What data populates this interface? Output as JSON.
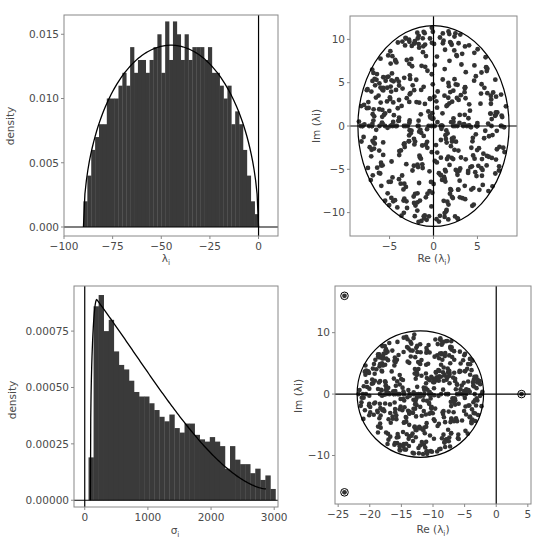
{
  "colors": {
    "bar": "#3a3a3a",
    "point": "#333333",
    "line": "#000000",
    "frame": "#888888",
    "text": "#4a4a4a"
  },
  "chart_data": [
    {
      "id": "top-left",
      "type": "bar",
      "title": "",
      "xlabel": "λi",
      "ylabel": "density",
      "xlim": [
        -100,
        10
      ],
      "ylim": [
        -0.0007,
        0.0165
      ],
      "xticks": [
        -100,
        -75,
        -50,
        -25,
        0
      ],
      "xtick_labels": [
        "−100",
        "−75",
        "−50",
        "−25",
        "0"
      ],
      "yticks": [
        0.0,
        0.005,
        0.01,
        0.015
      ],
      "ytick_labels": [
        "0.000",
        "0.005",
        "0.010",
        "0.015"
      ],
      "bin_start": -90,
      "bin_width": 2,
      "values": [
        0.002,
        0.004,
        0.006,
        0.007,
        0.008,
        0.008,
        0.01,
        0.01,
        0.01,
        0.011,
        0.012,
        0.011,
        0.014,
        0.012,
        0.013,
        0.013,
        0.012,
        0.013,
        0.014,
        0.015,
        0.012,
        0.016,
        0.013,
        0.016,
        0.015,
        0.013,
        0.015,
        0.013,
        0.014,
        0.014,
        0.014,
        0.013,
        0.014,
        0.012,
        0.012,
        0.011,
        0.01,
        0.011,
        0.008,
        0.009,
        0.008,
        0.006,
        0.004,
        0.002,
        0.001
      ],
      "curve": {
        "type": "semicircle",
        "center": -45,
        "radius": 45,
        "peak": 0.01415
      },
      "vline": 0,
      "hline": 0
    },
    {
      "id": "top-right",
      "type": "scatter",
      "xlabel": "Re (λi)",
      "ylabel": "Im (λi)",
      "xlim": [
        -9.5,
        9.5
      ],
      "ylim": [
        -12.7,
        12.7
      ],
      "xticks": [
        -5,
        0,
        5
      ],
      "xtick_labels": [
        "−5",
        "0",
        "5"
      ],
      "yticks": [
        -10,
        -5,
        0,
        5,
        10
      ],
      "ytick_labels": [
        "−10",
        "−5",
        "0",
        "5",
        "10"
      ],
      "ellipse": {
        "cx": 0,
        "cy": 0,
        "rx": 8.6,
        "ry": 11.6
      },
      "n_points": 500,
      "vline": 0,
      "hline": 0
    },
    {
      "id": "bottom-left",
      "type": "bar",
      "xlabel": "σi",
      "ylabel": "density",
      "xlim": [
        -170,
        3060
      ],
      "ylim": [
        -3e-05,
        0.00095
      ],
      "xticks": [
        0,
        1000,
        2000,
        3000
      ],
      "xtick_labels": [
        "0",
        "1000",
        "2000",
        "3000"
      ],
      "yticks": [
        0.0,
        0.00025,
        0.0005,
        0.00075
      ],
      "ytick_labels": [
        "0.00000",
        "0.00025",
        "0.00050",
        "0.00075"
      ],
      "bin_start": 60,
      "bin_width": 80,
      "values": [
        0.00019,
        0.00086,
        0.00091,
        0.00075,
        0.0008,
        0.00066,
        0.0006,
        0.00058,
        0.00053,
        0.00048,
        0.00046,
        0.00046,
        0.00043,
        0.0004,
        0.00037,
        0.00035,
        0.00038,
        0.00032,
        0.0003,
        0.00034,
        0.00034,
        0.00029,
        0.00027,
        0.00026,
        0.00028,
        0.00026,
        0.00024,
        0.00014,
        0.00024,
        0.00018,
        0.00016,
        0.00016,
        0.00012,
        0.00014,
        9e-05,
        0.00011,
        5e-05
      ],
      "curve": {
        "type": "decay-fit",
        "peak_x": 190,
        "peak_y": 0.00089,
        "end_x": 2870,
        "end_y": 5e-05
      },
      "vline": 0,
      "hline": 0
    },
    {
      "id": "bottom-right",
      "type": "scatter",
      "xlabel": "Re (λi)",
      "ylabel": "Im (λi)",
      "xlim": [
        -25.5,
        5.5
      ],
      "ylim": [
        -17.9,
        17.6
      ],
      "xticks": [
        -25,
        -20,
        -15,
        -10,
        -5,
        0,
        5
      ],
      "xtick_labels": [
        "−25",
        "−20",
        "−15",
        "−10",
        "−5",
        "0",
        "5"
      ],
      "yticks": [
        -10,
        0,
        10
      ],
      "ytick_labels": [
        "−10",
        "0",
        "10"
      ],
      "circle": {
        "cx": -12,
        "cy": 0,
        "r": 10
      },
      "n_points": 500,
      "outliers": [
        {
          "x": -24,
          "y": 16
        },
        {
          "x": -24,
          "y": -16
        },
        {
          "x": 4,
          "y": 0
        }
      ],
      "vline": 0,
      "hline": 0
    }
  ],
  "panels": {
    "tl": {
      "xlabel_main": "λ",
      "xlabel_sub": "i",
      "ylabel": "density"
    },
    "tr": {
      "xlabel_main": "Re (λ",
      "xlabel_sub": "i",
      "xlabel_close": ")",
      "ylabel": "Im (λi)"
    },
    "bl": {
      "xlabel_main": "σ",
      "xlabel_sub": "i",
      "ylabel": "density"
    },
    "br": {
      "xlabel_main": "Re (λ",
      "xlabel_sub": "i",
      "xlabel_close": ")",
      "ylabel": "Im (λi)"
    }
  }
}
